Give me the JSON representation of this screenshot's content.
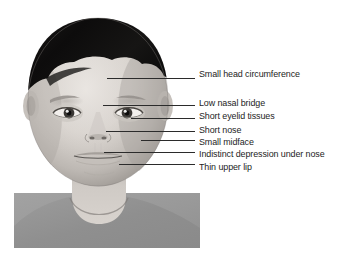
{
  "figure": {
    "type": "medical-illustration",
    "background_color": "#ffffff",
    "panel_color": "#9b9b9b",
    "line_color": "#2b2b2b",
    "text_color": "#1d1d1d"
  },
  "annotations": [
    {
      "id": "small-head-circumference",
      "label": "Small head circumference",
      "label_x": 199,
      "label_y": 69,
      "line_x": 107,
      "line_y": 78,
      "line_width": 88
    },
    {
      "id": "low-nasal-bridge",
      "label": "Low nasal bridge",
      "label_x": 199,
      "label_y": 98,
      "line_x": 103,
      "line_y": 105,
      "line_width": 92
    },
    {
      "id": "short-eyelid-tissues",
      "label": "Short eyelid tissues",
      "label_x": 199,
      "label_y": 111,
      "line_x": 131,
      "line_y": 118,
      "line_width": 64
    },
    {
      "id": "short-nose",
      "label": "Short nose",
      "label_x": 199,
      "label_y": 125,
      "line_x": 106,
      "line_y": 131,
      "line_width": 89
    },
    {
      "id": "small-midface",
      "label": "Small midface",
      "label_x": 199,
      "label_y": 137,
      "line_x": 141,
      "line_y": 140,
      "line_width": 54
    },
    {
      "id": "indistinct-depression-under-nose",
      "label": "Indistinct depression under nose",
      "label_x": 199,
      "label_y": 149,
      "line_x": 104,
      "line_y": 152,
      "line_width": 91
    },
    {
      "id": "thin-upper-lip",
      "label": "Thin upper lip",
      "label_x": 199,
      "label_y": 162,
      "line_x": 119,
      "line_y": 164,
      "line_width": 76
    }
  ]
}
